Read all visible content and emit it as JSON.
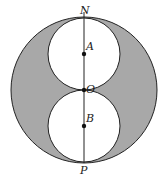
{
  "diagram": {
    "type": "geometry",
    "colors": {
      "shade": "#a8a8a8",
      "stroke": "#222222",
      "background": "#ffffff"
    },
    "labels": {
      "N": "N",
      "A": "A",
      "O": "O",
      "B": "B",
      "P": "P"
    }
  }
}
